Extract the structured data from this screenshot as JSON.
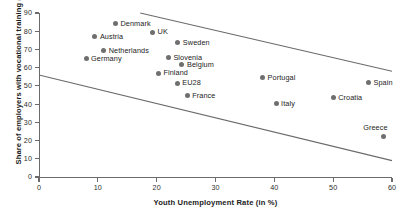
{
  "chart_data": {
    "type": "scatter",
    "title": "",
    "xlabel": "Youth Unemployment Rate (in %)",
    "ylabel": "Share of employers with vocational training (in %)",
    "xlim": [
      0,
      60
    ],
    "ylim": [
      0,
      90
    ],
    "xticks": [
      0,
      10,
      20,
      30,
      40,
      50,
      60
    ],
    "yticks": [
      0,
      10,
      20,
      30,
      40,
      50,
      60,
      70,
      80,
      90
    ],
    "grid": false,
    "legend": "none",
    "marker_color": "#6f6f6f",
    "line_color": "#6b6b6b",
    "points": [
      {
        "label": "Denmark",
        "x": 13.0,
        "y": 84.0,
        "label_pos": "right"
      },
      {
        "label": "UK",
        "x": 19.3,
        "y": 79.5,
        "label_pos": "right"
      },
      {
        "label": "Austria",
        "x": 9.5,
        "y": 77.0,
        "label_pos": "right"
      },
      {
        "label": "Sweden",
        "x": 23.6,
        "y": 73.8,
        "label_pos": "right"
      },
      {
        "label": "Netherlands",
        "x": 11.0,
        "y": 69.5,
        "label_pos": "right"
      },
      {
        "label": "Germany",
        "x": 8.0,
        "y": 65.0,
        "label_pos": "right"
      },
      {
        "label": "Slovenia",
        "x": 22.0,
        "y": 65.5,
        "label_pos": "right"
      },
      {
        "label": "Belgium",
        "x": 24.3,
        "y": 61.5,
        "label_pos": "right"
      },
      {
        "label": "Finland",
        "x": 20.3,
        "y": 57.0,
        "label_pos": "right"
      },
      {
        "label": "EU28",
        "x": 23.5,
        "y": 51.5,
        "label_pos": "right"
      },
      {
        "label": "Portugal",
        "x": 38.0,
        "y": 54.5,
        "label_pos": "right"
      },
      {
        "label": "Spain",
        "x": 56.0,
        "y": 52.0,
        "label_pos": "right"
      },
      {
        "label": "France",
        "x": 25.2,
        "y": 44.5,
        "label_pos": "right"
      },
      {
        "label": "Croatia",
        "x": 50.0,
        "y": 43.5,
        "label_pos": "right"
      },
      {
        "label": "Italy",
        "x": 40.3,
        "y": 40.5,
        "label_pos": "right"
      },
      {
        "label": "Greece",
        "x": 58.5,
        "y": 22.5,
        "label_pos": "above"
      }
    ],
    "trend_lines": [
      {
        "name": "upper-bound-line",
        "x1": 17.2,
        "y1": 90.0,
        "x2": 60.0,
        "y2": 58.0
      },
      {
        "name": "lower-bound-line",
        "x1": 0.0,
        "y1": 56.0,
        "x2": 60.0,
        "y2": 9.0
      }
    ]
  }
}
